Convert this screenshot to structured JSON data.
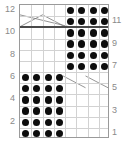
{
  "figure": {
    "kind": "dot-grid-diagram",
    "grid": {
      "columns": 8,
      "rows": 12
    },
    "colors": {
      "dot": "#0d0d0d",
      "gridline": "#d2d2d2",
      "border": "#9a9a9a",
      "rule": "#4a4a4a",
      "axis_text": "#8a8a8a",
      "diagonal": "#777777",
      "background": "#ffffff"
    }
  },
  "axis_left": {
    "name": "left-axis",
    "ticks": [
      {
        "label": "12",
        "row": 12
      },
      {
        "label": "10",
        "row": 10
      },
      {
        "label": "8",
        "row": 8
      },
      {
        "label": "6",
        "row": 6
      },
      {
        "label": "4",
        "row": 4
      },
      {
        "label": "2",
        "row": 2
      }
    ]
  },
  "axis_right": {
    "name": "right-axis",
    "ticks": [
      {
        "label": "11",
        "row": 11
      },
      {
        "label": "9",
        "row": 9
      },
      {
        "label": "7",
        "row": 7
      },
      {
        "label": "5",
        "row": 5
      },
      {
        "label": "3",
        "row": 3
      },
      {
        "label": "1",
        "row": 1
      }
    ]
  },
  "chart_data": {
    "type": "heatmap",
    "title": "",
    "xlabel": "",
    "ylabel": "",
    "x": [
      1,
      2,
      3,
      4,
      5,
      6,
      7,
      8
    ],
    "categories": [
      12,
      11,
      10,
      9,
      8,
      7,
      6,
      5,
      4,
      3,
      2,
      1
    ],
    "grid": true,
    "legend": "none",
    "note": "1 = filled dot, 0 = empty cell. Rows listed top (12) to bottom (1), columns left (1) to right (8).",
    "matrix": [
      [
        0,
        0,
        0,
        0,
        1,
        1,
        1,
        1
      ],
      [
        0,
        0,
        0,
        0,
        1,
        1,
        1,
        1
      ],
      [
        0,
        0,
        0,
        0,
        1,
        1,
        1,
        1
      ],
      [
        0,
        0,
        0,
        0,
        1,
        1,
        1,
        1
      ],
      [
        0,
        0,
        0,
        0,
        1,
        1,
        1,
        1
      ],
      [
        0,
        0,
        0,
        0,
        1,
        1,
        1,
        1
      ],
      [
        1,
        1,
        1,
        1,
        0,
        0,
        0,
        0
      ],
      [
        1,
        1,
        1,
        1,
        0,
        0,
        0,
        0
      ],
      [
        1,
        1,
        1,
        1,
        0,
        0,
        0,
        0
      ],
      [
        1,
        1,
        1,
        1,
        0,
        0,
        0,
        0
      ],
      [
        1,
        1,
        1,
        1,
        0,
        0,
        0,
        0
      ],
      [
        1,
        1,
        1,
        1,
        0,
        0,
        0,
        0
      ]
    ],
    "filled_blocks": [
      {
        "name": "top-right-block",
        "columns": [
          5,
          8
        ],
        "rows": [
          12,
          7
        ],
        "count": 24
      },
      {
        "name": "bottom-left-block",
        "columns": [
          1,
          4
        ],
        "rows": [
          6,
          1
        ],
        "count": 24
      }
    ],
    "total_dots": 48
  },
  "annotations": {
    "rule": {
      "name": "row-11-separator",
      "below_row": 11
    },
    "diagonals_top_left": [
      {
        "x1": 0,
        "y1": 10,
        "x2": 50,
        "y2": 22
      },
      {
        "x1": 0,
        "y1": 22,
        "x2": 23,
        "y2": 10
      },
      {
        "x1": 23,
        "y1": 10,
        "x2": 46,
        "y2": 22
      }
    ],
    "diagonals_bottom_right": [
      {
        "x1": 44,
        "y1": 72,
        "x2": 67,
        "y2": 84
      },
      {
        "x1": 67,
        "y1": 72,
        "x2": 90,
        "y2": 84
      }
    ]
  }
}
